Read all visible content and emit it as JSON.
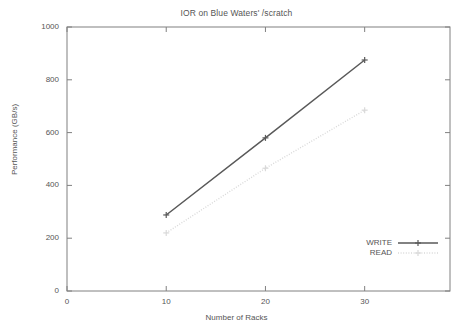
{
  "chart_data": {
    "type": "line",
    "title": "IOR on Blue Waters' /scratch",
    "xlabel": "Number of Racks",
    "ylabel": "Performance (GB/s)",
    "x": [
      10,
      20,
      30
    ],
    "xlim": [
      0,
      38.6
    ],
    "ylim": [
      0,
      1000
    ],
    "xticks": [
      0,
      10,
      20,
      30
    ],
    "xtick_labels": [
      "0",
      "10",
      "20",
      "30"
    ],
    "yticks": [
      0,
      200,
      400,
      600,
      800,
      1000
    ],
    "ytick_labels": [
      "0",
      "200",
      "400",
      "600",
      "800",
      "1000"
    ],
    "grid": false,
    "legend_position": "inside-bottom-right",
    "series": [
      {
        "name": "WRITE",
        "values": [
          288,
          580,
          875
        ],
        "color": "#595959",
        "style": "solid",
        "marker": "plus"
      },
      {
        "name": "READ",
        "values": [
          220,
          465,
          685
        ],
        "color": "#d9d9d9",
        "style": "dotted",
        "marker": "cross"
      }
    ]
  }
}
